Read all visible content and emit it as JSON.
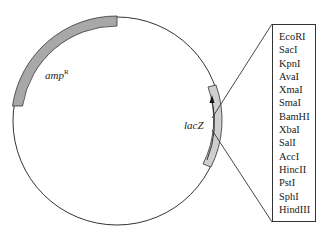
{
  "diagram": {
    "type": "plasmid-map",
    "genes": [
      {
        "name": "amp",
        "superscript": "R",
        "fill": "#a8a8a8"
      },
      {
        "name": "lacZ",
        "fill": "#c8c8c8"
      }
    ],
    "restriction_sites": [
      "EcoRI",
      "SacI",
      "KpnI",
      "AvaI",
      "XmaI",
      "SmaI",
      "BamHI",
      "XbaI",
      "SalI",
      "AccI",
      "HincII",
      "PstI",
      "SphI",
      "HindIII"
    ]
  }
}
